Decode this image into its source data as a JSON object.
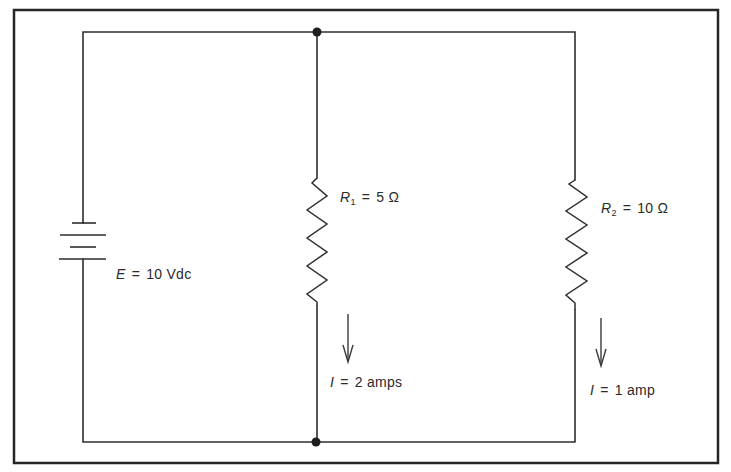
{
  "diagram": {
    "type": "parallel-circuit",
    "colors": {
      "line": "#2e2e2e",
      "background": "#ffffff",
      "frame": "#262626"
    },
    "source": {
      "symbol": "E",
      "equals": "=",
      "value": "10 Vdc"
    },
    "resistors": [
      {
        "symbol": "R",
        "subscript": "1",
        "equals": "=",
        "value": "5 Ω"
      },
      {
        "symbol": "R",
        "subscript": "2",
        "equals": "=",
        "value": "10 Ω"
      }
    ],
    "currents": [
      {
        "symbol": "I",
        "equals": "=",
        "value": "2 amps"
      },
      {
        "symbol": "I",
        "equals": "=",
        "value": "1 amp"
      }
    ]
  }
}
